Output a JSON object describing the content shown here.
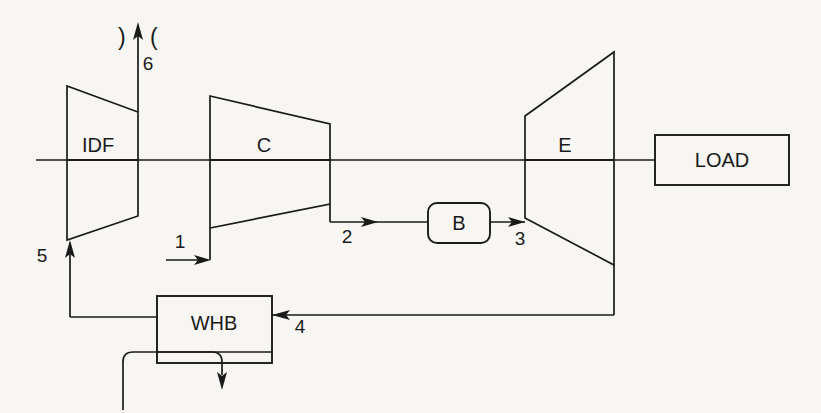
{
  "diagram": {
    "background_color": "#f7f6f3",
    "line_color": "#1a1a1a",
    "components": [
      {
        "id": "idf",
        "label": "IDF",
        "name": "induced-draft-fan",
        "shape": "trapezoid-converging",
        "label_x": 98,
        "label_y": 152
      },
      {
        "id": "c",
        "label": "C",
        "name": "compressor",
        "shape": "trapezoid-converging",
        "label_x": 264,
        "label_y": 152
      },
      {
        "id": "e",
        "label": "E",
        "name": "expander",
        "shape": "trapezoid-diverging",
        "label_x": 565,
        "label_y": 152
      },
      {
        "id": "b",
        "label": "B",
        "name": "burner-combustor",
        "shape": "rounded-rect",
        "label_x": 466,
        "label_y": 226
      },
      {
        "id": "whb",
        "label": "WHB",
        "name": "waste-heat-boiler",
        "shape": "rect",
        "label_x": 214,
        "label_y": 330
      },
      {
        "id": "load",
        "label": "LOAD",
        "name": "load",
        "shape": "rect",
        "label_x": 722,
        "label_y": 167
      }
    ],
    "state_points": [
      {
        "label": "1",
        "name": "state-point-1-compressor-inlet",
        "x": 180,
        "y": 248
      },
      {
        "label": "2",
        "name": "state-point-2-compressor-outlet",
        "x": 347,
        "y": 243
      },
      {
        "label": "3",
        "name": "state-point-3-expander-inlet",
        "x": 520,
        "y": 245
      },
      {
        "label": "4",
        "name": "state-point-4-expander-exhaust",
        "x": 300,
        "y": 333
      },
      {
        "label": "5",
        "name": "state-point-5-fan-inlet",
        "x": 42,
        "y": 262
      },
      {
        "label": "6",
        "name": "state-point-6-stack-exhaust",
        "x": 148,
        "y": 48
      }
    ],
    "stack": {
      "left_bracket": ")",
      "right_bracket": "(",
      "name": "stack-exhaust-symbol"
    },
    "flow_arrows": [
      {
        "name": "arrow-air-inlet-1",
        "direction": "right"
      },
      {
        "name": "arrow-compressed-air-2",
        "direction": "right"
      },
      {
        "name": "arrow-combustion-gas-3",
        "direction": "right"
      },
      {
        "name": "arrow-exhaust-gas-4",
        "direction": "left"
      },
      {
        "name": "arrow-cooled-gas-5",
        "direction": "up"
      },
      {
        "name": "arrow-stack-exhaust-6",
        "direction": "up"
      },
      {
        "name": "arrow-steam-outlet",
        "direction": "down"
      }
    ]
  }
}
